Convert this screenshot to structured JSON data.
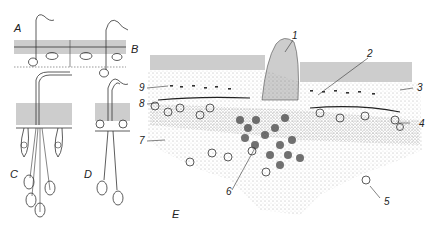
{
  "figure": {
    "panels": [
      {
        "id": "A",
        "label": "A"
      },
      {
        "id": "B",
        "label": "B"
      },
      {
        "id": "C",
        "label": "C"
      },
      {
        "id": "D",
        "label": "D"
      },
      {
        "id": "E",
        "label": "E"
      }
    ],
    "callouts": [
      {
        "id": "1",
        "label": "1"
      },
      {
        "id": "2",
        "label": "2"
      },
      {
        "id": "3",
        "label": "3"
      },
      {
        "id": "4",
        "label": "4"
      },
      {
        "id": "5",
        "label": "5"
      },
      {
        "id": "6",
        "label": "6"
      },
      {
        "id": "7",
        "label": "7"
      },
      {
        "id": "8",
        "label": "8"
      },
      {
        "id": "9",
        "label": "9"
      }
    ],
    "colors": {
      "ink": "#2a2a2a",
      "background": "#ffffff",
      "stipple": "#777777"
    }
  }
}
